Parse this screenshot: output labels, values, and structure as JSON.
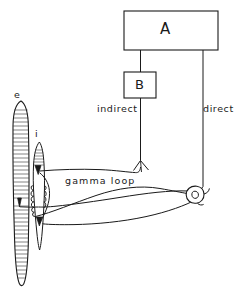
{
  "figure": {
    "type": "anatomical-schematic",
    "title_visible": false,
    "background_color": "#ffffff",
    "ink_color": "#1a1a1a"
  },
  "boxes": {
    "a": {
      "label": "A",
      "x": 124,
      "y": 11,
      "width": 94,
      "height": 39
    },
    "b": {
      "label": "B",
      "x": 124,
      "y": 72,
      "width": 32,
      "height": 26
    }
  },
  "labels": {
    "indirect": "indirect",
    "direct": "direct",
    "gamma_loop": "gamma loop",
    "extrafusal": "e",
    "intrafusal": "i"
  },
  "elements": {
    "extrafusal_fiber": "striated extrafusal muscle fibre (e) at left, long tapered spindle-shaped outline with transverse striations",
    "intrafusal_fiber": "intrafusal muscle fibre (i) of the muscle spindle, smaller tapered fibre to the right of e",
    "annulospiral_ending": "coiled annulospiral (primary) sensory ending wrapped around the equatorial region of the intrafusal fibre",
    "motor_end_plates": "filled triangular motor end plates on the intrafusal and extrafusal fibres",
    "motor_neuron_soma": "alpha motor neuron cell body with nucleus, drawn as a small circle at the right",
    "afferent_fiber": "sensory afferent fibre running from the annulospiral ending to the branch point below B",
    "efferent_fibers": "two long efferent fibres running from the motor neuron soma leftwards to the end plates"
  },
  "pathways": [
    {
      "name": "direct",
      "from": "A",
      "to": "alpha motor neuron",
      "label": "direct"
    },
    {
      "name": "indirect",
      "from": "A",
      "via": "B",
      "to": "intrafusal fibre / gamma loop",
      "label": "indirect"
    },
    {
      "name": "gamma loop",
      "from": "intrafusal fibre spindle",
      "to": "alpha motor neuron",
      "label": "gamma loop"
    }
  ]
}
